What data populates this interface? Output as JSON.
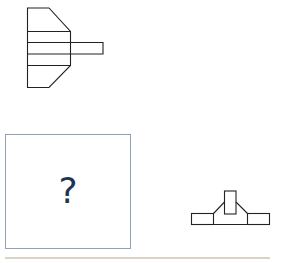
{
  "question_figure": {
    "shape": "front-view-projection",
    "stroke_color": "#222222"
  },
  "answer_box": {
    "placeholder": "?",
    "border_color": "#8fa2b8",
    "text_color": "#1e3552"
  },
  "option_figure": {
    "shape": "top-view-projection",
    "stroke_color": "#222222"
  },
  "divider": {
    "color": "#d9d4c3"
  }
}
